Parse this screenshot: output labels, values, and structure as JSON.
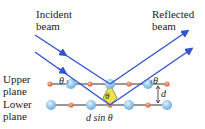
{
  "labels": {
    "incident": [
      "Incident",
      "beam"
    ],
    "reflected": [
      "Reflected",
      "beam"
    ],
    "upper_plane": [
      "Upper",
      "plane"
    ],
    "lower_plane": [
      "Lower",
      "plane"
    ],
    "theta": "θ",
    "d": "d",
    "path_difference": "d sin θ"
  },
  "colors": {
    "beam": "#3355cc",
    "plane_line": "#222222",
    "atom_large": "#8cc4ec",
    "atom_small": "#e07a55",
    "triangle": "#f2e24a"
  }
}
